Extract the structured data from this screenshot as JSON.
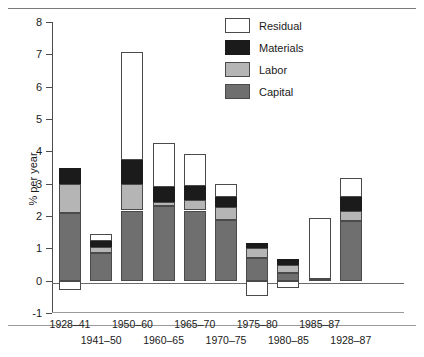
{
  "chart_data": {
    "type": "bar",
    "stacked": true,
    "title": "",
    "xlabel": "",
    "ylabel": "% per year",
    "ylim": [
      -1,
      8
    ],
    "yticks": [
      -1,
      0,
      1,
      2,
      3,
      4,
      5,
      6,
      7,
      8
    ],
    "ytick_labels": [
      "-1",
      "0",
      "1",
      "2",
      "3",
      "4",
      "5",
      "6",
      "7",
      "8"
    ],
    "grid": false,
    "legend_position": "top-right",
    "categories": [
      "1928–41",
      "1941–50",
      "1950–60",
      "1960–65",
      "1965–70",
      "1970–75",
      "1975–80",
      "1980–85",
      "1985–87",
      "1928–87"
    ],
    "series": [
      {
        "name": "Capital",
        "color": "#6f6f6f",
        "values": [
          2.1,
          0.87,
          2.17,
          2.3,
          2.17,
          1.87,
          0.7,
          0.23,
          0.05,
          1.83
        ]
      },
      {
        "name": "Labor",
        "color": "#b5b5b5",
        "values": [
          0.9,
          0.18,
          0.83,
          0.13,
          0.33,
          0.4,
          0.3,
          0.25,
          0.0,
          0.33
        ]
      },
      {
        "name": "Materials",
        "color": "#1b1b1b",
        "values": [
          0.5,
          0.18,
          0.73,
          0.47,
          0.43,
          0.33,
          0.17,
          0.2,
          0.0,
          0.43
        ]
      },
      {
        "name": "Residual",
        "color": "#ffffff",
        "values": [
          -0.3,
          0.2,
          3.34,
          1.37,
          1.0,
          0.4,
          -0.47,
          -0.23,
          1.88,
          0.57
        ]
      }
    ],
    "totals": [
      3.5,
      1.43,
      7.07,
      4.27,
      3.93,
      3.0,
      1.17,
      0.68,
      1.93,
      3.16
    ],
    "legend": [
      {
        "label": "Residual",
        "swatch": "residual"
      },
      {
        "label": "Materials",
        "swatch": "materials"
      },
      {
        "label": "Labor",
        "swatch": "labor"
      },
      {
        "label": "Capital",
        "swatch": "capital"
      }
    ]
  }
}
